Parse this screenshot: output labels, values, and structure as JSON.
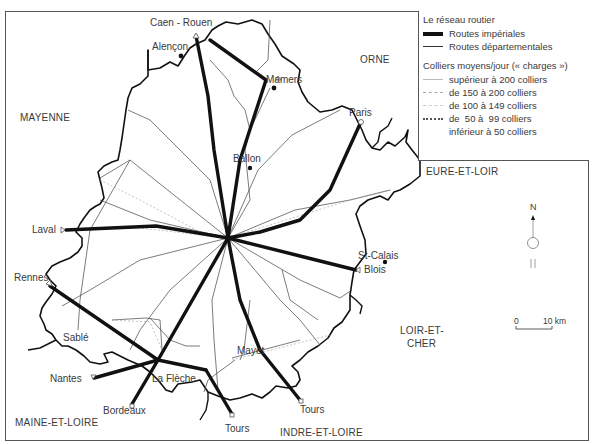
{
  "map": {
    "regions": [
      {
        "name": "ORNE",
        "x": 360,
        "y": 59
      },
      {
        "name": "MAYENNE",
        "x": 20,
        "y": 114
      },
      {
        "name": "EURE-ET-LOIR",
        "x": 426,
        "y": 170
      },
      {
        "name": "LOIR-ET-",
        "x": 400,
        "y": 328
      },
      {
        "name": "CHER",
        "x": 408,
        "y": 340
      },
      {
        "name": "MAINE-ET-LOIRE",
        "x": 15,
        "y": 419
      },
      {
        "name": "INDRE-ET-LOIRE",
        "x": 280,
        "y": 428
      }
    ],
    "destinations": [
      {
        "name": "Caen - Rouen",
        "x": 150,
        "y": 17
      },
      {
        "name": "Paris",
        "x": 357,
        "y": 130
      },
      {
        "name": "Blois",
        "x": 360,
        "y": 274
      },
      {
        "name": "Laval",
        "x": 32,
        "y": 226
      },
      {
        "name": "Rennes",
        "x": 15,
        "y": 273
      },
      {
        "name": "Nantes",
        "x": 50,
        "y": 374
      },
      {
        "name": "Bordeaux",
        "x": 103,
        "y": 406
      },
      {
        "name": "Tours",
        "x": 225,
        "y": 424
      },
      {
        "name": "Tours",
        "x": 301,
        "y": 405
      }
    ],
    "towns": [
      {
        "name": "Alençon",
        "x": 152,
        "y": 41
      },
      {
        "name": "Mamers",
        "x": 266,
        "y": 77
      },
      {
        "name": "Ballon",
        "x": 233,
        "y": 158
      },
      {
        "name": "St-Calais",
        "x": 358,
        "y": 252
      },
      {
        "name": "Sablé",
        "x": 63,
        "y": 334
      },
      {
        "name": "La Flèche",
        "x": 152,
        "y": 376
      },
      {
        "name": "Mayet",
        "x": 237,
        "y": 349
      }
    ],
    "compass": {
      "label": "N"
    },
    "scale": {
      "start": "0",
      "end": "10 km"
    }
  },
  "legend": {
    "title": "Le réseau routier",
    "road_types": [
      {
        "label": "Routes impériales",
        "style": "imperial"
      },
      {
        "label": "Routes départementales",
        "style": "departmental"
      }
    ],
    "traffic_title": "Colliers moyens/jour (« charges »)",
    "traffic_classes": [
      {
        "label": "supérieur à 200 colliers",
        "style": "gt200"
      },
      {
        "label": "de 150 à 200 colliers",
        "style": "150-200"
      },
      {
        "label": "de 100 à 149 colliers",
        "style": "100-149"
      },
      {
        "label": "de  50 à  99 colliers",
        "style": "50-99"
      },
      {
        "label": "inférieur à 50 colliers",
        "style": "lt50"
      }
    ]
  },
  "colors": {
    "imperial_road": "#111111",
    "departmental_road": "#333333",
    "border": "#111111",
    "text": "#3a3a3a"
  }
}
